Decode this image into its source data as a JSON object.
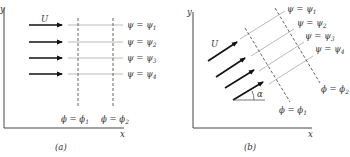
{
  "figure_a": {
    "caption": "(a)",
    "axis_y_label": "y",
    "axis_x_label": "x",
    "velocity_label": "U",
    "streamlines": [
      {
        "lhs": "ψ = ψ",
        "sub": "1"
      },
      {
        "lhs": "ψ = ψ",
        "sub": "2"
      },
      {
        "lhs": "ψ = ψ",
        "sub": "3"
      },
      {
        "lhs": "ψ = ψ",
        "sub": "4"
      }
    ],
    "potential_lines": [
      {
        "lhs": "ϕ = ϕ",
        "sub": "1"
      },
      {
        "lhs": "ϕ = ϕ",
        "sub": "2"
      }
    ]
  },
  "figure_b": {
    "caption": "(b)",
    "axis_y_label": "y",
    "axis_x_label": "x",
    "velocity_label": "U",
    "angle_label": "α",
    "streamlines": [
      {
        "lhs": "ψ = ψ",
        "sub": "1"
      },
      {
        "lhs": "ψ = ψ",
        "sub": "2"
      },
      {
        "lhs": "ψ = ψ",
        "sub": "3"
      },
      {
        "lhs": "ψ = ψ",
        "sub": "4"
      }
    ],
    "potential_lines": [
      {
        "lhs": "ϕ = ϕ",
        "sub": "1"
      },
      {
        "lhs": "ϕ = ϕ",
        "sub": "2"
      }
    ]
  }
}
